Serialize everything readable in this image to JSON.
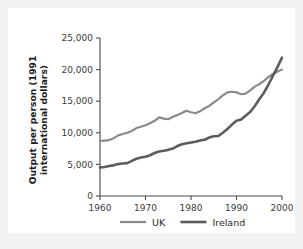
{
  "chart_data": {
    "type": "line",
    "title": "",
    "xlabel": "",
    "ylabel": "Output per person (1991 international dollars)",
    "ylabel_line1": "Output per person (1991",
    "ylabel_line2": "international dollars)",
    "xlim": [
      1960,
      2000
    ],
    "ylim": [
      0,
      25000
    ],
    "grid": false,
    "legend_position": "bottom",
    "xticks": [
      1960,
      1970,
      1980,
      1990,
      2000
    ],
    "xtick_labels": [
      "1960",
      "1970",
      "1980",
      "1990",
      "2000"
    ],
    "yticks": [
      0,
      5000,
      10000,
      15000,
      20000,
      25000
    ],
    "ytick_labels": [
      "0",
      "5,000",
      "10,000",
      "15,000",
      "20,000",
      "25,000"
    ],
    "x": [
      1960,
      1961,
      1962,
      1963,
      1964,
      1965,
      1966,
      1967,
      1968,
      1969,
      1970,
      1971,
      1972,
      1973,
      1974,
      1975,
      1976,
      1977,
      1978,
      1979,
      1980,
      1981,
      1982,
      1983,
      1984,
      1985,
      1986,
      1987,
      1988,
      1989,
      1990,
      1991,
      1992,
      1993,
      1994,
      1995,
      1996,
      1997,
      1998,
      1999,
      2000
    ],
    "series": [
      {
        "name": "UK",
        "color": "#8a8a8a",
        "width": 2.2,
        "values": [
          8700,
          8750,
          8850,
          9150,
          9600,
          9800,
          10000,
          10300,
          10750,
          10950,
          11200,
          11500,
          11900,
          12450,
          12250,
          12150,
          12550,
          12800,
          13150,
          13500,
          13250,
          13100,
          13400,
          13900,
          14250,
          14800,
          15300,
          15950,
          16400,
          16500,
          16400,
          16100,
          16200,
          16700,
          17300,
          17700,
          18200,
          18800,
          19300,
          19700,
          20000
        ]
      },
      {
        "name": "Ireland",
        "color": "#5c5c5c",
        "width": 2.6,
        "values": [
          4500,
          4600,
          4750,
          4850,
          5050,
          5150,
          5200,
          5550,
          5900,
          6100,
          6200,
          6450,
          6800,
          7050,
          7150,
          7300,
          7500,
          7900,
          8200,
          8350,
          8450,
          8600,
          8800,
          8900,
          9250,
          9450,
          9500,
          10000,
          10600,
          11300,
          11900,
          12100,
          12700,
          13300,
          14200,
          15300,
          16300,
          17600,
          19000,
          20400,
          21900
        ]
      }
    ],
    "legend": [
      {
        "label": "UK",
        "color": "#8a8a8a",
        "width": 2.2
      },
      {
        "label": "Ireland",
        "color": "#5c5c5c",
        "width": 2.6
      }
    ]
  }
}
